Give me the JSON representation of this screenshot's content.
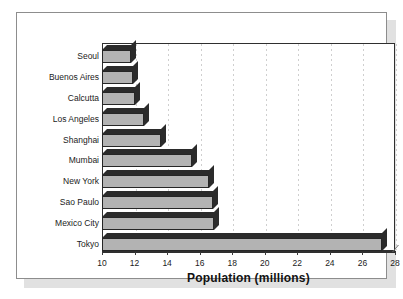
{
  "chart_data": {
    "type": "bar",
    "orientation": "horizontal",
    "title": "",
    "xlabel": "Population (millions)",
    "ylabel": "",
    "xlim": [
      10,
      28
    ],
    "xticks": [
      10,
      12,
      14,
      16,
      18,
      20,
      22,
      24,
      26,
      28
    ],
    "grid": true,
    "legend": false,
    "categories": [
      "Seoul",
      "Buenos Aires",
      "Calcutta",
      "Los Angeles",
      "Shanghai",
      "Mumbai",
      "New York",
      "Sao Paulo",
      "Mexico City",
      "Tokyo"
    ],
    "values": [
      11.8,
      11.9,
      12.0,
      12.6,
      13.6,
      15.5,
      16.6,
      16.8,
      16.9,
      27.2
    ],
    "bar_fill_color": "#b3b3b3",
    "bar_edge_color": "#262626",
    "bar_shade_color": "#2b2b2b",
    "gridline_color": "#cfcfcf",
    "axis_color": "#2f2f2f"
  },
  "frame": {
    "border_color": "#8d8d8d",
    "background": "#ffffff"
  }
}
